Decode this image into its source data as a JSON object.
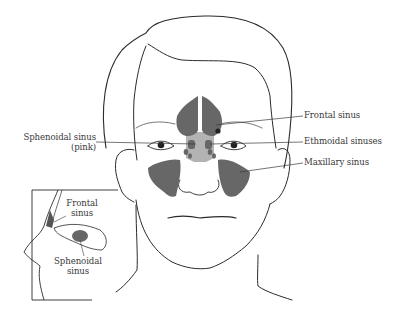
{
  "diagram": {
    "colors": {
      "sinus_fill": "#676767",
      "sphenoid_fill": "#b3b3b3",
      "line": "#2b2b2b",
      "label_text": "#3a3a3a",
      "background": "#ffffff"
    },
    "labels": {
      "frontal": "Frontal sinus",
      "ethmoidal": "Ethmoidal sinuses",
      "maxillary": "Maxillary sinus",
      "sphenoidal_line1": "Sphenoidal sinus",
      "sphenoidal_line2": "(pink)"
    },
    "inset": {
      "frontal_line1": "Frontal",
      "frontal_line2": "sinus",
      "sphenoidal_line1": "Sphenoidal",
      "sphenoidal_line2": "sinus"
    }
  }
}
